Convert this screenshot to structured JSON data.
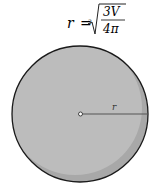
{
  "formula": {
    "lhs": "r",
    "equals": "=",
    "root_index": "3",
    "numerator": "3V",
    "denominator": "4π"
  },
  "figure": {
    "shape": "sphere",
    "radius_label": "r",
    "center_marker": "o",
    "colors": {
      "fill": "#b9b9b9",
      "shadow": "#a3a3a3",
      "outline": "#1a1a1a",
      "radius_line": "#555555"
    }
  }
}
